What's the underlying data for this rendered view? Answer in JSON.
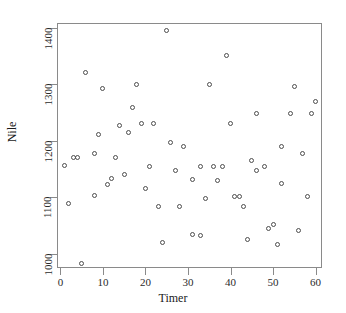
{
  "chart_data": {
    "type": "scatter",
    "title": "",
    "xlabel": "Timer",
    "ylabel": "Nile",
    "xlim": [
      -0.8,
      61.5
    ],
    "ylim": [
      975,
      1408
    ],
    "grid": false,
    "legend": null,
    "marker": "open-circle",
    "marker_color": "#4d4d4d",
    "xticks": [
      0,
      10,
      20,
      30,
      40,
      50,
      60
    ],
    "xtick_labels": [
      "0",
      "10",
      "20",
      "30",
      "40",
      "50",
      "60"
    ],
    "yticks": [
      1000,
      1100,
      1200,
      1300,
      1400
    ],
    "ytick_labels": [
      "1000",
      "1100",
      "1200",
      "1300",
      "1400"
    ],
    "n_points": 70,
    "x": [
      1,
      2,
      3,
      4,
      5,
      6,
      7,
      8,
      9,
      10,
      11,
      12,
      13,
      14,
      15,
      16,
      17,
      18,
      19,
      20,
      21,
      22,
      23,
      24,
      25,
      26,
      27,
      28,
      29,
      30,
      31,
      32,
      33,
      34,
      35,
      36,
      37,
      38,
      39,
      40,
      41,
      42,
      43,
      44,
      45,
      46,
      47,
      48,
      49,
      50,
      51,
      52,
      53,
      54,
      55,
      56,
      57,
      58,
      59,
      60
    ],
    "y": [
      1157,
      1089,
      1170,
      1171,
      983,
      1321,
      1178,
      1103,
      1292,
      1211,
      1123,
      1133,
      1171,
      1227,
      1141,
      1215,
      1258,
      1299,
      1231,
      1116,
      1155,
      1231,
      1083,
      1020,
      1395,
      1197,
      1148,
      1083,
      1190,
      1131,
      1034,
      1033,
      1155,
      1097,
      1156,
      1129,
      1155,
      1350,
      1231,
      1102,
      1102,
      1083,
      1026,
      1165,
      1148,
      1248,
      1155,
      1044,
      1052,
      1016,
      1125,
      1190,
      1248,
      1296,
      1178,
      1042,
      1102,
      1248,
      1270,
      1248
    ],
    "points": [
      {
        "x": 1,
        "y": 1157
      },
      {
        "x": 2,
        "y": 1089
      },
      {
        "x": 3,
        "y": 1170
      },
      {
        "x": 4,
        "y": 1171
      },
      {
        "x": 5,
        "y": 983
      },
      {
        "x": 6,
        "y": 1321
      },
      {
        "x": 8,
        "y": 1178
      },
      {
        "x": 8,
        "y": 1103
      },
      {
        "x": 10,
        "y": 1292
      },
      {
        "x": 9,
        "y": 1211
      },
      {
        "x": 11,
        "y": 1123
      },
      {
        "x": 12,
        "y": 1133
      },
      {
        "x": 13,
        "y": 1171
      },
      {
        "x": 14,
        "y": 1227
      },
      {
        "x": 15,
        "y": 1141
      },
      {
        "x": 16,
        "y": 1215
      },
      {
        "x": 17,
        "y": 1258
      },
      {
        "x": 18,
        "y": 1299
      },
      {
        "x": 19,
        "y": 1231
      },
      {
        "x": 20,
        "y": 1116
      },
      {
        "x": 21,
        "y": 1155
      },
      {
        "x": 22,
        "y": 1231
      },
      {
        "x": 23,
        "y": 1083
      },
      {
        "x": 24,
        "y": 1020
      },
      {
        "x": 25,
        "y": 1395
      },
      {
        "x": 26,
        "y": 1197
      },
      {
        "x": 27,
        "y": 1148
      },
      {
        "x": 28,
        "y": 1083
      },
      {
        "x": 29,
        "y": 1190
      },
      {
        "x": 31,
        "y": 1131
      },
      {
        "x": 31,
        "y": 1034
      },
      {
        "x": 33,
        "y": 1033
      },
      {
        "x": 33,
        "y": 1155
      },
      {
        "x": 34,
        "y": 1097
      },
      {
        "x": 35,
        "y": 1299
      },
      {
        "x": 36,
        "y": 1155
      },
      {
        "x": 37,
        "y": 1129
      },
      {
        "x": 38,
        "y": 1155
      },
      {
        "x": 39,
        "y": 1350
      },
      {
        "x": 40,
        "y": 1231
      },
      {
        "x": 41,
        "y": 1102
      },
      {
        "x": 42,
        "y": 1102
      },
      {
        "x": 43,
        "y": 1083
      },
      {
        "x": 44,
        "y": 1026
      },
      {
        "x": 45,
        "y": 1165
      },
      {
        "x": 46,
        "y": 1148
      },
      {
        "x": 46,
        "y": 1248
      },
      {
        "x": 48,
        "y": 1155
      },
      {
        "x": 49,
        "y": 1044
      },
      {
        "x": 50,
        "y": 1052
      },
      {
        "x": 51,
        "y": 1016
      },
      {
        "x": 52,
        "y": 1190
      },
      {
        "x": 52,
        "y": 1125
      },
      {
        "x": 54,
        "y": 1248
      },
      {
        "x": 55,
        "y": 1296
      },
      {
        "x": 56,
        "y": 1042
      },
      {
        "x": 57,
        "y": 1178
      },
      {
        "x": 58,
        "y": 1102
      },
      {
        "x": 59,
        "y": 1248
      },
      {
        "x": 60,
        "y": 1270
      }
    ]
  }
}
